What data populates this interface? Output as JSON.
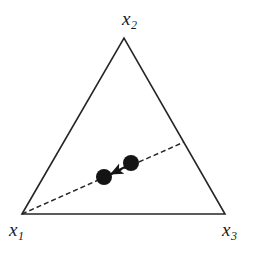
{
  "figure": {
    "type": "ternary-simplex-diagram",
    "background_color": "#ffffff",
    "stroke_color": "#262626",
    "marker_color": "#141414"
  },
  "labels": {
    "x1": {
      "base": "x",
      "sub": "1"
    },
    "x2": {
      "base": "x",
      "sub": "2"
    },
    "x3": {
      "base": "x",
      "sub": "3"
    }
  },
  "chart_data": {
    "type": "scatter",
    "title": "",
    "xlabel": "",
    "ylabel": "",
    "triangle": {
      "vertices": [
        {
          "name": "x1",
          "x": 22,
          "y": 214
        },
        {
          "name": "x2",
          "x": 124,
          "y": 38
        },
        {
          "name": "x3",
          "x": 225,
          "y": 214
        }
      ],
      "stroke_width": 1.6,
      "closed": true
    },
    "dashed_ray": {
      "from": {
        "name": "x1",
        "x": 22,
        "y": 214
      },
      "to": {
        "x": 184,
        "y": 142
      },
      "dash_pattern": [
        5,
        3
      ],
      "stroke_width": 1.4
    },
    "points": [
      {
        "name": "current-point",
        "x": 131,
        "y": 163,
        "radius": 8
      },
      {
        "name": "target-point",
        "x": 104,
        "y": 177,
        "radius": 8
      }
    ],
    "arrow": {
      "from": {
        "x": 127,
        "y": 166
      },
      "to": {
        "x": 111,
        "y": 174
      },
      "direction": "toward-x1",
      "stroke_width": 2
    },
    "grid": false,
    "legend": null
  }
}
